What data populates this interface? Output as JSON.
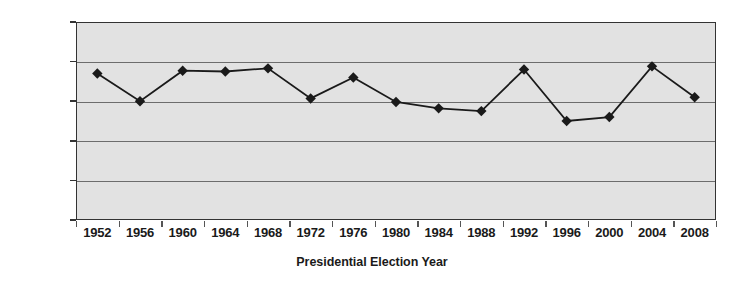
{
  "chart_data": {
    "type": "line",
    "title": "",
    "xlabel": "Presidential Election Year",
    "ylabel": "Percentage reporting “very much interested”",
    "ylabel_lines": [
      "Percentage reporting",
      "“very much interested”"
    ],
    "categories": [
      "1952",
      "1956",
      "1960",
      "1964",
      "1968",
      "1972",
      "1976",
      "1980",
      "1984",
      "1988",
      "1992",
      "1996",
      "2000",
      "2004",
      "2008"
    ],
    "values": [
      37,
      30,
      37.7,
      37.5,
      38.3,
      30.7,
      36,
      29.8,
      28.2,
      27.5,
      38,
      25,
      26,
      38.8,
      31
    ],
    "series": [
      {
        "name": "Percentage reporting very much interested",
        "values": [
          37,
          30,
          37.7,
          37.5,
          38.3,
          30.7,
          36,
          29.8,
          28.2,
          27.5,
          38,
          25,
          26,
          38.8,
          31
        ]
      }
    ],
    "ylim": [
      0,
      50
    ],
    "yticks": [
      0,
      10,
      20,
      30,
      40,
      50
    ],
    "ytick_labels": [
      "0",
      "10",
      "20",
      "30",
      "40",
      "50"
    ],
    "grid": true,
    "legend": false,
    "marker": "diamond",
    "line_color": "#1a1a1a",
    "marker_color": "#1a1a1a",
    "plot_background": "#e2e2e2",
    "gridline_color": "#6d6d6d",
    "axis_color": "#333333"
  }
}
